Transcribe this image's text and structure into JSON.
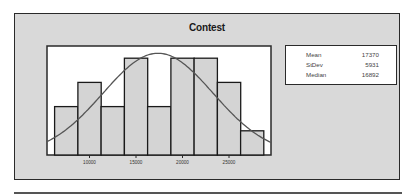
{
  "chart_data": {
    "type": "bar",
    "subtype": "histogram_with_normal_fit",
    "title": "Contest",
    "xlabel": "",
    "ylabel": "",
    "bin_edges": [
      6250,
      8750,
      11250,
      13750,
      16250,
      18750,
      21250,
      23750,
      26250,
      28750
    ],
    "categories": [
      "6250-8750",
      "8750-11250",
      "11250-13750",
      "13750-16250",
      "16250-18750",
      "18750-21250",
      "21250-23750",
      "23750-26250",
      "26250-28750"
    ],
    "values": [
      2,
      3,
      2,
      4,
      2,
      4,
      4,
      3,
      1
    ],
    "x_ticks": [
      10000,
      15000,
      20000,
      25000
    ],
    "x_tick_labels": [
      "10000",
      "15000",
      "20000",
      "25000"
    ],
    "xlim": [
      5000,
      30000
    ],
    "grid": false,
    "fit_curve": {
      "type": "normal",
      "mean": 17370,
      "stdev": 5931
    },
    "legend": {
      "position": "right",
      "entries": [
        {
          "label": "Mean",
          "value": "17370"
        },
        {
          "label": "StDev",
          "value": "5931"
        },
        {
          "label": "Median",
          "value": "16892"
        }
      ]
    },
    "colors": {
      "panel_bg": "#d9d9d9",
      "plot_bg": "#ffffff",
      "bar_fill": "#d4d4d4",
      "bar_stroke": "#1a1a1a",
      "curve": "#555555",
      "frame": "#2a2a2a"
    }
  },
  "panel": {
    "title": "Contest"
  },
  "stats": [
    {
      "label": "Mean",
      "value": "17370"
    },
    {
      "label": "StDev",
      "value": "5931"
    },
    {
      "label": "Median",
      "value": "16892"
    }
  ]
}
